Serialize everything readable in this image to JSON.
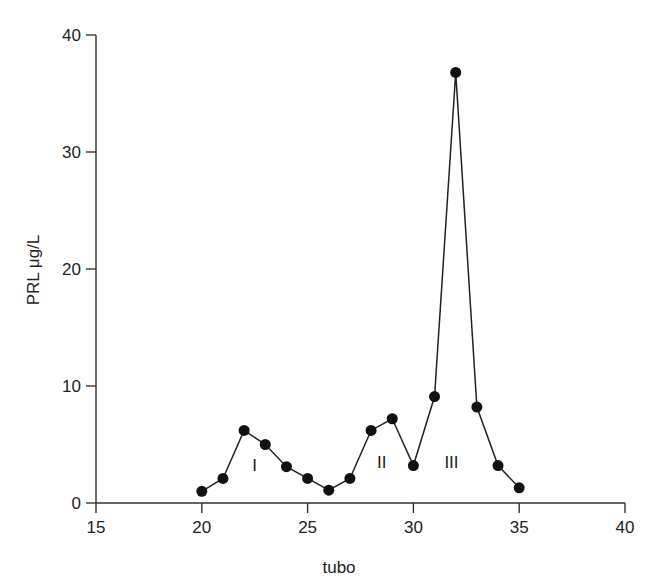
{
  "chart_data": {
    "type": "line",
    "title": "",
    "xlabel": "tubo",
    "ylabel": "PRL μg/L",
    "xlim": [
      15,
      40
    ],
    "ylim": [
      0,
      40
    ],
    "x_ticks": [
      15,
      20,
      25,
      30,
      35,
      40
    ],
    "y_ticks": [
      0,
      10,
      20,
      30,
      40
    ],
    "grid": false,
    "legend": null,
    "series": [
      {
        "name": "PRL",
        "marker": "filled-circle",
        "color": "#111111",
        "x": [
          20,
          21,
          22,
          23,
          24,
          25,
          26,
          27,
          28,
          29,
          30,
          31,
          32,
          33,
          34,
          35
        ],
        "values": [
          1.0,
          2.1,
          6.2,
          5.0,
          3.1,
          2.1,
          1.1,
          2.1,
          6.2,
          7.2,
          3.2,
          9.1,
          36.8,
          8.2,
          3.2,
          1.3
        ]
      }
    ],
    "annotations": [
      {
        "text": "I",
        "x": 22.5,
        "y": 2.7
      },
      {
        "text": "II",
        "x": 28.5,
        "y": 3.0
      },
      {
        "text": "III",
        "x": 31.8,
        "y": 3.0
      }
    ]
  }
}
